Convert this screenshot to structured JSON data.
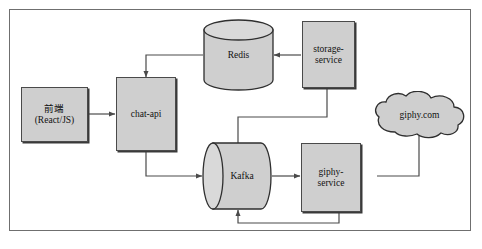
{
  "diagram": {
    "frame": {
      "border_color": "#6f6f6f",
      "background": "#ffffff"
    },
    "palette": {
      "node_fill": "#cfcfcf",
      "node_stroke": "#4a4a4a",
      "cylinder_highlight": "#d9d9d9",
      "edge_color": "#4a4a4a",
      "text_color": "#111111"
    },
    "nodes": [
      {
        "id": "frontend",
        "shape": "rectangle",
        "label": "前端\n(React/JS)"
      },
      {
        "id": "chat-api",
        "shape": "rectangle",
        "label": "chat-api"
      },
      {
        "id": "redis",
        "shape": "cylinder-vertical",
        "label": "Redis"
      },
      {
        "id": "storage-service",
        "shape": "rectangle",
        "label": "storage-\nservice"
      },
      {
        "id": "kafka",
        "shape": "cylinder-horizontal",
        "label": "Kafka"
      },
      {
        "id": "giphy-service",
        "shape": "rectangle",
        "label": "giphy-\nservice"
      },
      {
        "id": "giphy-com",
        "shape": "cloud",
        "label": "giphy.com"
      }
    ],
    "edges": [
      {
        "id": "frontend-to-chat-api",
        "from": "frontend",
        "to": "chat-api",
        "arrow": true
      },
      {
        "id": "redis-to-chat-api",
        "from": "redis",
        "to": "chat-api",
        "arrow": true
      },
      {
        "id": "storage-service-to-redis",
        "from": "storage-service",
        "to": "redis",
        "arrow": true
      },
      {
        "id": "storage-service-to-kafka",
        "from": "storage-service",
        "to": "kafka",
        "arrow": false
      },
      {
        "id": "chat-api-to-kafka",
        "from": "chat-api",
        "to": "kafka",
        "arrow": true
      },
      {
        "id": "kafka-to-giphy-service",
        "from": "kafka",
        "to": "giphy-service",
        "arrow": true
      },
      {
        "id": "giphy-service-to-kafka",
        "from": "giphy-service",
        "to": "kafka",
        "arrow": true
      },
      {
        "id": "giphy-service-to-giphy-com",
        "from": "giphy-service",
        "to": "giphy-com",
        "arrow": false
      }
    ]
  }
}
